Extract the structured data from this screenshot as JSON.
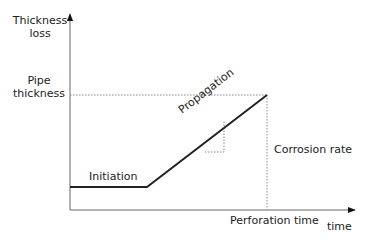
{
  "diagram": {
    "y_axis_label": [
      "Thickness",
      "loss"
    ],
    "x_axis_label": "time",
    "pipe_thickness_label": [
      "Pipe",
      "thickness"
    ],
    "phases": {
      "initiation": "Initiation",
      "propagation": "Propagation"
    },
    "corrosion_rate_label": "Corrosion rate",
    "perforation_time_label": "Perforation time",
    "colors": {
      "line": "#222222",
      "axis": "#555555",
      "dotted": "#777777"
    },
    "geometry": {
      "origin": [
        70,
        210
      ],
      "y_axis_top": 12,
      "x_axis_right": 357,
      "initiation_level_y": 187,
      "initiation_end_x": 147,
      "perforation_x": 267,
      "pipe_thickness_y": 95,
      "slope_triangle": {
        "corner": [
          224,
          152
        ],
        "left_x": 210,
        "top_y": 120
      }
    }
  }
}
